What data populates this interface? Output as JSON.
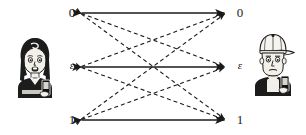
{
  "figure": {
    "background_color": "#ffffff",
    "line_color": "#1a1a1a",
    "width": 306,
    "height": 135
  },
  "sender": {
    "name": "sender-avatar",
    "description": "cartoon woman with dark bob haircut holding a mobile phone",
    "position": {
      "x": 12,
      "y": 36
    },
    "size": {
      "w": 46,
      "h": 62
    }
  },
  "receiver": {
    "name": "receiver-avatar",
    "description": "cartoon man wearing a white cap holding a mobile phone",
    "position": {
      "x": 250,
      "y": 32
    },
    "size": {
      "w": 46,
      "h": 64
    }
  },
  "input_nodes": [
    {
      "id": "in-0",
      "label": "0",
      "style": "digit",
      "x": 80,
      "y": 13
    },
    {
      "id": "in-e",
      "label": "ε",
      "style": "greek",
      "x": 80,
      "y": 67
    },
    {
      "id": "in-1",
      "label": "1",
      "style": "digit",
      "x": 80,
      "y": 120
    }
  ],
  "output_nodes": [
    {
      "id": "out-0",
      "label": "0",
      "style": "digit",
      "x": 226,
      "y": 13
    },
    {
      "id": "out-e",
      "label": "ε",
      "style": "greek",
      "x": 226,
      "y": 67
    },
    {
      "id": "out-1",
      "label": "1",
      "style": "digit",
      "x": 226,
      "y": 120
    }
  ],
  "edges": [
    {
      "id": "e-0-0",
      "from": "in-0",
      "to": "out-0",
      "style": "solid",
      "direction": "both"
    },
    {
      "id": "e-e-e",
      "from": "in-e",
      "to": "out-e",
      "style": "solid",
      "direction": "both"
    },
    {
      "id": "e-1-1",
      "from": "in-1",
      "to": "out-1",
      "style": "solid",
      "direction": "both"
    },
    {
      "id": "e-0-e",
      "from": "in-0",
      "to": "out-e",
      "style": "dashed",
      "direction": "both"
    },
    {
      "id": "e-0-1",
      "from": "in-0",
      "to": "out-1",
      "style": "dashed",
      "direction": "both"
    },
    {
      "id": "e-e-0",
      "from": "in-e",
      "to": "out-0",
      "style": "dashed",
      "direction": "both"
    },
    {
      "id": "e-e-1",
      "from": "in-e",
      "to": "out-1",
      "style": "dashed",
      "direction": "both"
    },
    {
      "id": "e-1-0",
      "from": "in-1",
      "to": "out-0",
      "style": "dashed",
      "direction": "both"
    },
    {
      "id": "e-1-e",
      "from": "in-1",
      "to": "out-e",
      "style": "dashed",
      "direction": "both"
    }
  ],
  "label_offsets": {
    "input_label_dx": -16,
    "output_label_dx": 6,
    "label_dy": -7
  }
}
